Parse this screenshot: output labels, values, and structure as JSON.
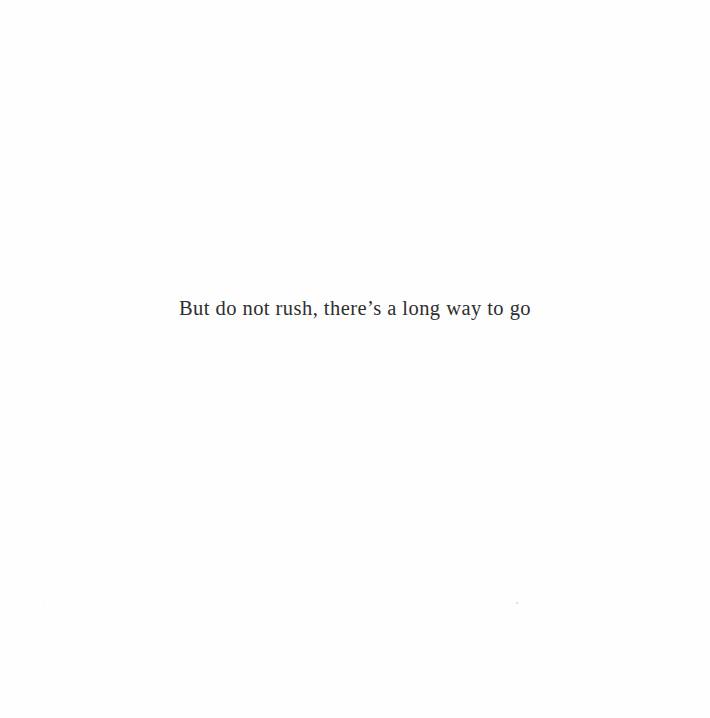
{
  "page": {
    "text_line": "But do not rush, there’s a long way to go"
  }
}
